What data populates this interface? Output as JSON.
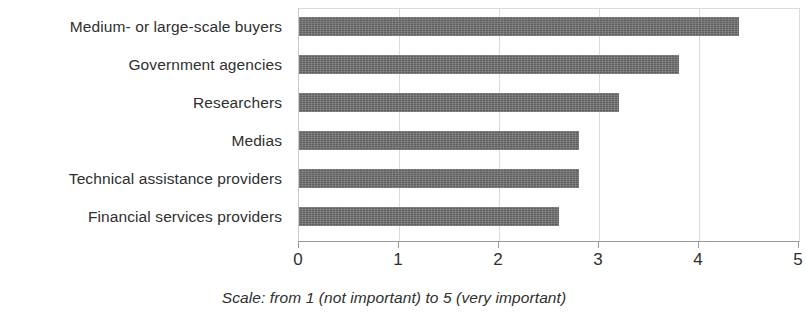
{
  "chart_data": {
    "type": "bar",
    "orientation": "horizontal",
    "title": "",
    "subtitle": "",
    "xlabel": "",
    "ylabel": "",
    "caption": "Scale: from 1 (not important) to 5 (very important)",
    "categories": [
      "Medium- or large-scale buyers",
      "Government agencies",
      "Researchers",
      "Medias",
      "Technical assistance providers",
      "Financial services providers"
    ],
    "values": [
      4.4,
      3.8,
      3.2,
      2.8,
      2.8,
      2.6
    ],
    "xlim": [
      0,
      5
    ],
    "xticks": [
      0,
      1,
      2,
      3,
      4,
      5
    ],
    "xtick_labels": [
      "0",
      "1",
      "2",
      "3",
      "4",
      "5"
    ],
    "grid": true,
    "grid_axis": "x",
    "legend": false,
    "legend_position": "none",
    "bar_color": "#6e6e6e"
  }
}
